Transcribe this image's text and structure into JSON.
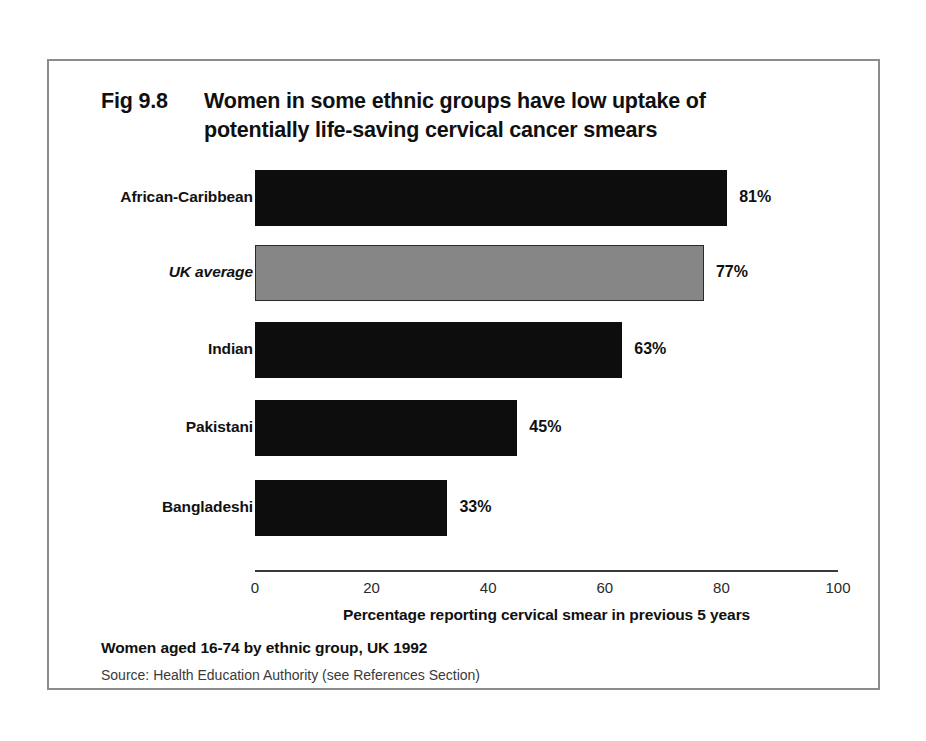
{
  "figure": {
    "number_label": "Fig 9.8",
    "title_line_1": "Women in some ethnic groups have low uptake of",
    "title_line_2": "potentially life-saving cervical cancer smears",
    "footnote": "Women aged 16-74 by ethnic group, UK 1992",
    "source": "Source: Health Education Authority (see References Section)"
  },
  "chart_data": {
    "type": "bar",
    "orientation": "horizontal",
    "subtitle": "Women aged 16-74 by ethnic group, UK 1992",
    "xlabel": "Percentage reporting cervical smear in previous 5 years",
    "ylabel": "",
    "xlim": [
      0,
      100
    ],
    "xticks": [
      "0",
      "20",
      "40",
      "60",
      "80",
      "100"
    ],
    "grid": false,
    "legend": "none",
    "categories": [
      "African-Caribbean",
      "UK average",
      "Indian",
      "Pakistani",
      "Bangladeshi"
    ],
    "values": [
      81,
      77,
      63,
      45,
      33
    ],
    "value_labels": [
      "81%",
      "77%",
      "63%",
      "45%",
      "33%"
    ],
    "bar_styles": [
      "dark",
      "gray",
      "dark",
      "dark",
      "dark"
    ],
    "colors": {
      "dark_bar": "#0d0d0d",
      "gray_bar": "#868686",
      "gray_bar_border": "#2a2a2a",
      "axis": "#3a3a3a",
      "frame": "#8c8c8c",
      "text": "#101010",
      "background": "#ffffff"
    }
  }
}
